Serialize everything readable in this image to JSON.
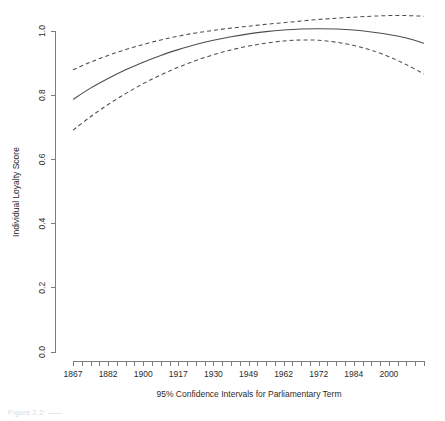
{
  "chart_data": {
    "type": "line",
    "title": "",
    "subtitle": "",
    "xlabel": "95% Confidence Intervals for Parliamentary Term",
    "ylabel": "Individual Loyalty Score",
    "ylim": [
      0.0,
      1.05
    ],
    "yticks": [
      "0.0",
      "0.2",
      "0.4",
      "0.6",
      "0.8",
      "1.0"
    ],
    "ytick_values": [
      0.0,
      0.2,
      0.4,
      0.6,
      0.8,
      1.0
    ],
    "xtick_labels": [
      "1867",
      "1882",
      "1900",
      "1917",
      "1930",
      "1949",
      "1962",
      "1972",
      "1984",
      "2000"
    ],
    "xtick_positions": [
      0,
      4,
      8,
      12,
      16,
      20,
      24,
      28,
      32,
      36
    ],
    "n_minor_ticks": 41,
    "grid": false,
    "legend": "none",
    "series": [
      {
        "name": "Fitted loyalty score",
        "style": "solid",
        "color": "#4d4d4d",
        "x": [
          0,
          2,
          4,
          6,
          8,
          10,
          12,
          14,
          16,
          18,
          20,
          22,
          24,
          26,
          28,
          30,
          32,
          34,
          36,
          38,
          40
        ],
        "values": [
          0.787,
          0.822,
          0.852,
          0.879,
          0.903,
          0.924,
          0.942,
          0.958,
          0.971,
          0.982,
          0.991,
          0.998,
          1.003,
          1.006,
          1.007,
          1.006,
          1.003,
          0.997,
          0.989,
          0.978,
          0.962
        ]
      },
      {
        "name": "Upper 95% confidence bound",
        "style": "dashed",
        "color": "#4d4d4d",
        "x": [
          0,
          2,
          4,
          6,
          8,
          10,
          12,
          14,
          16,
          18,
          20,
          22,
          24,
          26,
          28,
          30,
          32,
          34,
          36,
          38,
          40
        ],
        "values": [
          0.879,
          0.903,
          0.924,
          0.942,
          0.958,
          0.972,
          0.984,
          0.994,
          1.002,
          1.009,
          1.015,
          1.021,
          1.026,
          1.031,
          1.036,
          1.04,
          1.043,
          1.046,
          1.048,
          1.048,
          1.046
        ]
      },
      {
        "name": "Lower 95% confidence bound",
        "style": "dashed",
        "color": "#4d4d4d",
        "x": [
          0,
          2,
          4,
          6,
          8,
          10,
          12,
          14,
          16,
          18,
          20,
          22,
          24,
          26,
          28,
          30,
          32,
          34,
          36,
          38,
          40
        ],
        "values": [
          0.691,
          0.733,
          0.771,
          0.805,
          0.836,
          0.863,
          0.887,
          0.908,
          0.926,
          0.941,
          0.953,
          0.962,
          0.969,
          0.972,
          0.971,
          0.965,
          0.955,
          0.94,
          0.92,
          0.895,
          0.866
        ]
      }
    ]
  },
  "caption": {
    "partial_text": "Figure 2.2: ——"
  }
}
